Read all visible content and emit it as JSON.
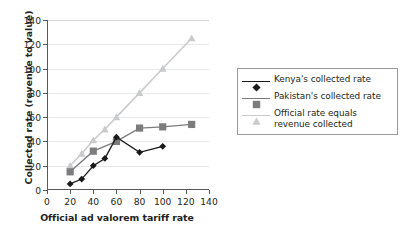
{
  "chart_data": {
    "type": "line",
    "title": "",
    "xlabel": "Official ad valorem tariff rate",
    "ylabel": "Collected rate (revenue to value)",
    "xlim": [
      0,
      140
    ],
    "ylim": [
      0,
      140
    ],
    "xticks": [
      0,
      20,
      40,
      60,
      80,
      100,
      120,
      140
    ],
    "yticks": [
      0,
      20,
      40,
      60,
      80,
      100,
      120,
      140
    ],
    "xtick_labels": [
      "0",
      "20",
      "40",
      "60",
      "80",
      "100",
      "120",
      "140"
    ],
    "ytick_labels": [
      "0",
      "20",
      "40",
      "60",
      "80",
      "100",
      "120",
      "140"
    ],
    "grid": "horizontal",
    "legend_position": "right",
    "series": [
      {
        "name": "Kenya's collected rate",
        "marker": "diamond",
        "color": "#1a1a1a",
        "x": [
          20,
          30,
          40,
          50,
          60,
          80,
          100
        ],
        "values": [
          5,
          9,
          20,
          26,
          43.5,
          31,
          36
        ]
      },
      {
        "name": "Pakistan's collected rate",
        "marker": "square",
        "color": "#7c7c7e",
        "x": [
          20,
          40,
          60,
          80,
          100,
          125
        ],
        "values": [
          15,
          32,
          40,
          51,
          52,
          54
        ]
      },
      {
        "name": "Official rate equals revenue collected",
        "marker": "triangle",
        "color": "#c9cacb",
        "x": [
          20,
          30,
          40,
          50,
          60,
          80,
          100,
          125
        ],
        "values": [
          20,
          30,
          41,
          50,
          60,
          80,
          100,
          125
        ]
      }
    ]
  },
  "legend": {
    "entries": [
      {
        "label": "Kenya's collected rate",
        "marker": "diamond-marker-icon",
        "color": "#1a1a1a"
      },
      {
        "label": "Pakistan's collected rate",
        "marker": "square-marker-icon",
        "color": "#7c7c7e"
      },
      {
        "label": "Official rate equals revenue collected",
        "marker": "triangle-marker-icon",
        "color": "#c9cacb"
      }
    ]
  }
}
